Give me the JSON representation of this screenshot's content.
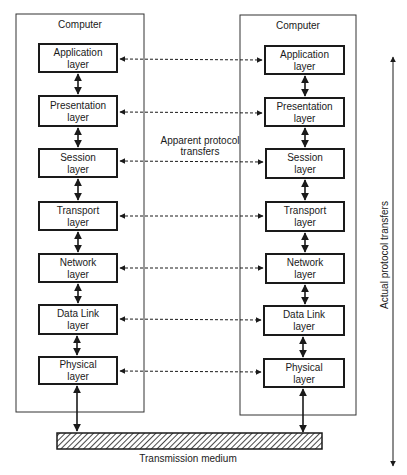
{
  "diagram": {
    "left_computer": {
      "title": "Computer"
    },
    "right_computer": {
      "title": "Computer"
    },
    "layers": [
      {
        "line1": "Application",
        "line2": "layer"
      },
      {
        "line1": "Presentation",
        "line2": "layer"
      },
      {
        "line1": "Session",
        "line2": "layer"
      },
      {
        "line1": "Transport",
        "line2": "layer"
      },
      {
        "line1": "Network",
        "line2": "layer"
      },
      {
        "line1": "Data Link",
        "line2": "layer"
      },
      {
        "line1": "Physical",
        "line2": "layer"
      }
    ],
    "apparent_label": {
      "line1": "Apparent protocol",
      "line2": "transfers"
    },
    "actual_label": "Actual protocol transfers",
    "medium_label": "Transmission medium",
    "colors": {
      "ink": "#1a1a1a",
      "background": "#ffffff"
    }
  }
}
